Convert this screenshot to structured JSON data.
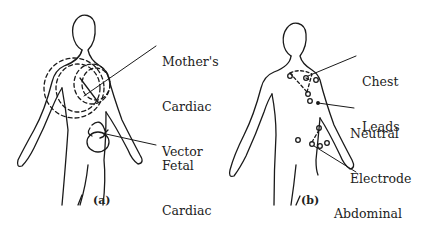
{
  "figure": {
    "panel_a": {
      "label": "(a)",
      "annotations": {
        "mother_vector": [
          "Mother's",
          "Cardiac",
          "Vector"
        ],
        "fetal_vector": [
          "Fetal",
          "Cardiac",
          "Vector"
        ]
      }
    },
    "panel_b": {
      "label": "(b)",
      "annotations": {
        "chest_leads": [
          "Chest",
          "Leads"
        ],
        "neutral_electrode": [
          "Neutral",
          "Electrode"
        ],
        "abdominal_leads": [
          "Abdominal",
          "Lead",
          "Placements"
        ]
      }
    }
  }
}
